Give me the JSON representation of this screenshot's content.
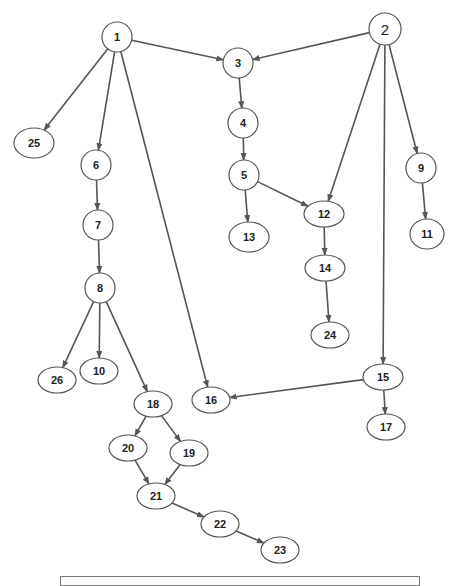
{
  "diagram": {
    "type": "directed-graph",
    "colors": {
      "edge": "#555555",
      "node_border": "#555555",
      "text": "#222222",
      "background": "#ffffff"
    },
    "nodes": [
      {
        "id": "1",
        "label": "1",
        "cx": 117,
        "cy": 37,
        "rx": 15,
        "ry": 15
      },
      {
        "id": "2",
        "label": "2",
        "cx": 385,
        "cy": 29,
        "rx": 16,
        "ry": 16
      },
      {
        "id": "3",
        "label": "3",
        "cx": 238,
        "cy": 63,
        "rx": 15,
        "ry": 15
      },
      {
        "id": "4",
        "label": "4",
        "cx": 243,
        "cy": 123,
        "rx": 15,
        "ry": 15
      },
      {
        "id": "5",
        "label": "5",
        "cx": 244,
        "cy": 175,
        "rx": 15,
        "ry": 15
      },
      {
        "id": "6",
        "label": "6",
        "cx": 96,
        "cy": 165,
        "rx": 15,
        "ry": 15
      },
      {
        "id": "7",
        "label": "7",
        "cx": 98,
        "cy": 225,
        "rx": 15,
        "ry": 15
      },
      {
        "id": "8",
        "label": "8",
        "cx": 100,
        "cy": 288,
        "rx": 15,
        "ry": 15
      },
      {
        "id": "9",
        "label": "9",
        "cx": 421,
        "cy": 168,
        "rx": 15,
        "ry": 15
      },
      {
        "id": "10",
        "label": "10",
        "cx": 99,
        "cy": 371,
        "rx": 19,
        "ry": 13
      },
      {
        "id": "11",
        "label": "11",
        "cx": 427,
        "cy": 234,
        "rx": 17,
        "ry": 15
      },
      {
        "id": "12",
        "label": "12",
        "cx": 324,
        "cy": 214,
        "rx": 20,
        "ry": 13
      },
      {
        "id": "13",
        "label": "13",
        "cx": 249,
        "cy": 237,
        "rx": 20,
        "ry": 15
      },
      {
        "id": "14",
        "label": "14",
        "cx": 325,
        "cy": 268,
        "rx": 20,
        "ry": 13
      },
      {
        "id": "15",
        "label": "15",
        "cx": 383,
        "cy": 377,
        "rx": 20,
        "ry": 13
      },
      {
        "id": "16",
        "label": "16",
        "cx": 211,
        "cy": 400,
        "rx": 19,
        "ry": 13
      },
      {
        "id": "17",
        "label": "17",
        "cx": 386,
        "cy": 427,
        "rx": 19,
        "ry": 13
      },
      {
        "id": "18",
        "label": "18",
        "cx": 153,
        "cy": 404,
        "rx": 19,
        "ry": 13
      },
      {
        "id": "19",
        "label": "19",
        "cx": 189,
        "cy": 453,
        "rx": 19,
        "ry": 13
      },
      {
        "id": "20",
        "label": "20",
        "cx": 128,
        "cy": 448,
        "rx": 19,
        "ry": 13
      },
      {
        "id": "21",
        "label": "21",
        "cx": 156,
        "cy": 496,
        "rx": 19,
        "ry": 13
      },
      {
        "id": "22",
        "label": "22",
        "cx": 220,
        "cy": 524,
        "rx": 19,
        "ry": 13
      },
      {
        "id": "23",
        "label": "23",
        "cx": 280,
        "cy": 550,
        "rx": 19,
        "ry": 13
      },
      {
        "id": "24",
        "label": "24",
        "cx": 330,
        "cy": 335,
        "rx": 19,
        "ry": 13
      },
      {
        "id": "25",
        "label": "25",
        "cx": 34,
        "cy": 143,
        "rx": 20,
        "ry": 15
      },
      {
        "id": "26",
        "label": "26",
        "cx": 57,
        "cy": 380,
        "rx": 19,
        "ry": 13
      }
    ],
    "edges": [
      {
        "from": "1",
        "to": "3"
      },
      {
        "from": "1",
        "to": "25"
      },
      {
        "from": "1",
        "to": "6"
      },
      {
        "from": "1",
        "to": "16"
      },
      {
        "from": "2",
        "to": "3"
      },
      {
        "from": "2",
        "to": "12"
      },
      {
        "from": "2",
        "to": "15"
      },
      {
        "from": "2",
        "to": "9"
      },
      {
        "from": "3",
        "to": "4"
      },
      {
        "from": "4",
        "to": "5"
      },
      {
        "from": "5",
        "to": "13"
      },
      {
        "from": "5",
        "to": "12"
      },
      {
        "from": "6",
        "to": "7"
      },
      {
        "from": "7",
        "to": "8"
      },
      {
        "from": "8",
        "to": "26"
      },
      {
        "from": "8",
        "to": "10"
      },
      {
        "from": "8",
        "to": "18"
      },
      {
        "from": "9",
        "to": "11"
      },
      {
        "from": "12",
        "to": "14"
      },
      {
        "from": "14",
        "to": "24"
      },
      {
        "from": "15",
        "to": "16"
      },
      {
        "from": "15",
        "to": "17"
      },
      {
        "from": "18",
        "to": "20"
      },
      {
        "from": "18",
        "to": "19"
      },
      {
        "from": "20",
        "to": "21"
      },
      {
        "from": "19",
        "to": "21"
      },
      {
        "from": "21",
        "to": "22"
      },
      {
        "from": "22",
        "to": "23"
      }
    ]
  }
}
